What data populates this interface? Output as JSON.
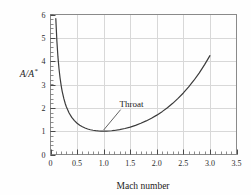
{
  "chart_data": {
    "type": "line",
    "title": "",
    "subtitle": "",
    "xlabel": "Mach number",
    "ylabel": "A/A*",
    "ylabel_base": "A/A",
    "ylabel_superscript": "*",
    "xlim": [
      0,
      3.5
    ],
    "ylim": [
      0,
      6
    ],
    "xticks": [
      0,
      0.5,
      1.0,
      1.5,
      2.0,
      2.5,
      3.0,
      3.5
    ],
    "xticklabels": [
      "0",
      "0.5",
      "1.0",
      "1.5",
      "2.0",
      "2.5",
      "3.0",
      "3.5"
    ],
    "yticks": [
      0,
      1,
      2,
      3,
      4,
      5,
      6
    ],
    "yticklabels": [
      "0",
      "1",
      "2",
      "3",
      "4",
      "5",
      "6"
    ],
    "x_minor_tick_interval": 0.1,
    "y_minor_tick_interval": 0.2,
    "grid": true,
    "grid_color": "#d8d8d8",
    "grid_x_interval": 0.5,
    "grid_y_interval": 1,
    "legend": null,
    "curve_color": "#3b3b3b",
    "axis_color": "#555555",
    "background_color": "#fefefe",
    "series": [
      {
        "name": "A/A* isentropic area ratio (gamma = 1.4)",
        "x": [
          0.1,
          0.12,
          0.14,
          0.16,
          0.18,
          0.2,
          0.22,
          0.25,
          0.28,
          0.3,
          0.35,
          0.4,
          0.45,
          0.5,
          0.55,
          0.6,
          0.65,
          0.7,
          0.75,
          0.8,
          0.85,
          0.9,
          0.95,
          1.0,
          1.05,
          1.1,
          1.15,
          1.2,
          1.3,
          1.4,
          1.5,
          1.6,
          1.7,
          1.8,
          1.9,
          2.0,
          2.1,
          2.2,
          2.3,
          2.4,
          2.5,
          2.6,
          2.7,
          2.8,
          2.9,
          3.0
        ],
        "y": [
          5.822,
          4.864,
          4.182,
          3.673,
          3.278,
          2.964,
          2.708,
          2.403,
          2.166,
          2.035,
          1.778,
          1.59,
          1.449,
          1.34,
          1.255,
          1.188,
          1.136,
          1.094,
          1.062,
          1.038,
          1.021,
          1.009,
          1.002,
          1.0,
          1.002,
          1.008,
          1.017,
          1.03,
          1.066,
          1.115,
          1.176,
          1.25,
          1.338,
          1.439,
          1.555,
          1.687,
          1.837,
          2.005,
          2.193,
          2.403,
          2.637,
          2.896,
          3.183,
          3.5,
          3.85,
          4.235
        ]
      }
    ],
    "annotations": [
      {
        "text": "Throat",
        "text_x": 1.3,
        "text_y": 2.05,
        "pointer_to_x": 1.0,
        "pointer_to_y": 1.05,
        "description": "leader line from label down-left to curve minimum"
      }
    ]
  }
}
